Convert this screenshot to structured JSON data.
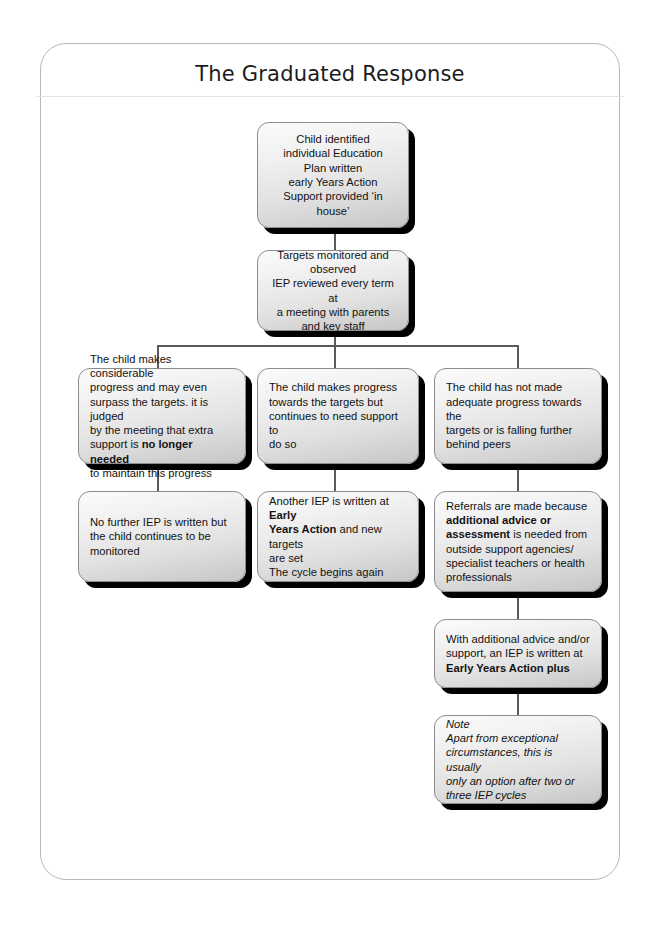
{
  "page": {
    "title": "The Graduated Response"
  },
  "diagram": {
    "type": "flowchart",
    "orientation": "top-down",
    "nodes": [
      {
        "id": "n1",
        "name": "child-identified-box",
        "align": "center",
        "italic": false,
        "lines": [
          [
            {
              "t": "Child identified",
              "b": false
            }
          ],
          [
            {
              "t": "individual Education",
              "b": false
            }
          ],
          [
            {
              "t": "Plan written",
              "b": false
            }
          ],
          [
            {
              "t": "early Years Action",
              "b": false
            }
          ],
          [
            {
              "t": "Support provided ‘in house’",
              "b": false
            }
          ]
        ]
      },
      {
        "id": "n2",
        "name": "targets-monitored-box",
        "align": "center",
        "italic": false,
        "lines": [
          [
            {
              "t": "Targets monitored and",
              "b": false
            }
          ],
          [
            {
              "t": "observed",
              "b": false
            }
          ],
          [
            {
              "t": "IEP reviewed every term at",
              "b": false
            }
          ],
          [
            {
              "t": "a meeting with parents",
              "b": false
            }
          ],
          [
            {
              "t": "and key staff",
              "b": false
            }
          ]
        ]
      },
      {
        "id": "n3",
        "name": "considerable-progress-box",
        "align": "left",
        "italic": false,
        "lines": [
          [
            {
              "t": "The child makes considerable",
              "b": false
            }
          ],
          [
            {
              "t": "progress and may even",
              "b": false
            }
          ],
          [
            {
              "t": "surpass the targets. it is judged",
              "b": false
            }
          ],
          [
            {
              "t": "by the meeting that extra",
              "b": false
            }
          ],
          [
            {
              "t": "support is ",
              "b": false
            },
            {
              "t": "no longer needed",
              "b": true
            }
          ],
          [
            {
              "t": "to maintain this progress",
              "b": false
            }
          ]
        ]
      },
      {
        "id": "n4",
        "name": "makes-progress-needs-support-box",
        "align": "left",
        "italic": false,
        "lines": [
          [
            {
              "t": "The child makes progress",
              "b": false
            }
          ],
          [
            {
              "t": "towards the targets but",
              "b": false
            }
          ],
          [
            {
              "t": "continues to need support to",
              "b": false
            }
          ],
          [
            {
              "t": "do so",
              "b": false
            }
          ]
        ]
      },
      {
        "id": "n5",
        "name": "not-made-adequate-progress-box",
        "align": "left",
        "italic": false,
        "lines": [
          [
            {
              "t": "The child has not made",
              "b": false
            }
          ],
          [
            {
              "t": "adequate progress towards the",
              "b": false
            }
          ],
          [
            {
              "t": "targets or is falling further",
              "b": false
            }
          ],
          [
            {
              "t": "behind peers",
              "b": false
            }
          ]
        ]
      },
      {
        "id": "n6",
        "name": "no-further-iep-box",
        "align": "left",
        "italic": false,
        "lines": [
          [
            {
              "t": "No further IEP is written but",
              "b": false
            }
          ],
          [
            {
              "t": "the child continues to be",
              "b": false
            }
          ],
          [
            {
              "t": "monitored",
              "b": false
            }
          ]
        ]
      },
      {
        "id": "n7",
        "name": "another-iep-box",
        "align": "left",
        "italic": false,
        "lines": [
          [
            {
              "t": "Another IEP is written at ",
              "b": false
            },
            {
              "t": "Early",
              "b": true
            }
          ],
          [
            {
              "t": "Years Action",
              "b": true
            },
            {
              "t": " and new targets",
              "b": false
            }
          ],
          [
            {
              "t": "are set",
              "b": false
            }
          ],
          [
            {
              "t": "The cycle begins again",
              "b": false
            }
          ]
        ]
      },
      {
        "id": "n8",
        "name": "referrals-made-box",
        "align": "left",
        "italic": false,
        "lines": [
          [
            {
              "t": "Referrals are made because",
              "b": false
            }
          ],
          [
            {
              "t": "additional advice or",
              "b": true
            }
          ],
          [
            {
              "t": "assessment",
              "b": true
            },
            {
              "t": " is needed from",
              "b": false
            }
          ],
          [
            {
              "t": "outside support agencies/",
              "b": false
            }
          ],
          [
            {
              "t": "specialist teachers or health",
              "b": false
            }
          ],
          [
            {
              "t": "professionals",
              "b": false
            }
          ]
        ]
      },
      {
        "id": "n9",
        "name": "early-years-action-plus-box",
        "align": "left",
        "italic": false,
        "lines": [
          [
            {
              "t": "With additional advice and/or",
              "b": false
            }
          ],
          [
            {
              "t": "support, an IEP is written at",
              "b": false
            }
          ],
          [
            {
              "t": "Early Years Action plus",
              "b": true
            }
          ]
        ]
      },
      {
        "id": "n10",
        "name": "note-box",
        "align": "left",
        "italic": true,
        "lines": [
          [
            {
              "t": "Note",
              "b": false
            }
          ],
          [
            {
              "t": "Apart from exceptional",
              "b": false
            }
          ],
          [
            {
              "t": "circumstances, this is usually",
              "b": false
            }
          ],
          [
            {
              "t": "only an option after two or",
              "b": false
            }
          ],
          [
            {
              "t": "three IEP cycles",
              "b": false
            }
          ]
        ]
      }
    ]
  }
}
